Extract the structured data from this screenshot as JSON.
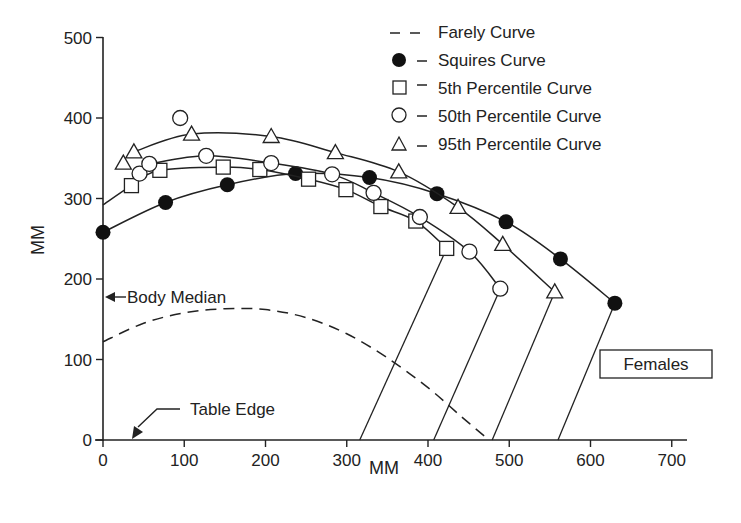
{
  "chart_data": {
    "type": "scatter",
    "title": "",
    "xlabel": "MM",
    "ylabel": "MM",
    "xlim": [
      0,
      700
    ],
    "ylim": [
      0,
      500
    ],
    "x_ticks": [
      0,
      100,
      200,
      300,
      400,
      500,
      600,
      700
    ],
    "y_ticks": [
      0,
      100,
      200,
      300,
      400,
      500
    ],
    "grid": false,
    "legend_position": "top-right",
    "legend": [
      {
        "marker": "dashed-line",
        "label": "Farely Curve"
      },
      {
        "marker": "filled-circle",
        "label": "Squires Curve"
      },
      {
        "marker": "open-square",
        "label": "5th Percentile Curve"
      },
      {
        "marker": "open-circle",
        "label": "50th Percentile Curve"
      },
      {
        "marker": "open-triangle",
        "label": "95th Percentile Curve"
      }
    ],
    "series": [
      {
        "name": "Farely Curve",
        "style": "dashed",
        "points": [
          [
            0,
            122
          ],
          [
            50,
            145
          ],
          [
            100,
            158
          ],
          [
            150,
            163
          ],
          [
            200,
            162
          ],
          [
            250,
            152
          ],
          [
            300,
            132
          ],
          [
            350,
            102
          ],
          [
            400,
            65
          ],
          [
            440,
            30
          ],
          [
            475,
            0
          ]
        ]
      },
      {
        "name": "Squires Curve",
        "marker": "filled-circle",
        "points": [
          [
            0,
            258
          ],
          [
            77,
            295
          ],
          [
            153,
            317
          ],
          [
            237,
            331
          ],
          [
            328,
            326
          ],
          [
            411,
            306
          ],
          [
            496,
            271
          ],
          [
            563,
            225
          ],
          [
            630,
            170
          ]
        ],
        "drop_line": [
          [
            630,
            170
          ],
          [
            560,
            0
          ]
        ]
      },
      {
        "name": "5th Percentile Curve",
        "marker": "open-square",
        "fit_start": [
          0,
          292
        ],
        "points": [
          [
            35,
            316
          ],
          [
            70,
            335
          ],
          [
            148,
            339
          ],
          [
            193,
            336
          ],
          [
            253,
            324
          ],
          [
            299,
            311
          ],
          [
            342,
            290
          ],
          [
            385,
            272
          ],
          [
            423,
            238
          ]
        ],
        "drop_line": [
          [
            423,
            238
          ],
          [
            316,
            0
          ]
        ]
      },
      {
        "name": "50th Percentile Curve",
        "marker": "open-circle",
        "points": [
          [
            45,
            331
          ],
          [
            57,
            343
          ],
          [
            95,
            400
          ],
          [
            127,
            353
          ],
          [
            207,
            344
          ],
          [
            282,
            330
          ],
          [
            333,
            307
          ],
          [
            390,
            277
          ],
          [
            451,
            234
          ],
          [
            489,
            188
          ]
        ],
        "drop_line": [
          [
            489,
            188
          ],
          [
            407,
            0
          ]
        ]
      },
      {
        "name": "95th Percentile Curve",
        "marker": "open-triangle",
        "points": [
          [
            25,
            344
          ],
          [
            38,
            358
          ],
          [
            109,
            380
          ],
          [
            207,
            377
          ],
          [
            286,
            357
          ],
          [
            364,
            333
          ],
          [
            437,
            289
          ],
          [
            492,
            243
          ],
          [
            556,
            184
          ]
        ],
        "drop_line": [
          [
            556,
            184
          ],
          [
            479,
            0
          ]
        ]
      }
    ],
    "annotations": [
      {
        "text": "Body Median",
        "points_to": [
          0,
          178
        ]
      },
      {
        "text": "Table Edge",
        "points_to": [
          35,
          0
        ]
      },
      {
        "text": "Females",
        "boxed": true
      }
    ]
  },
  "axes": {
    "x_title": "MM",
    "y_title": "MM",
    "x_ticks": [
      "0",
      "100",
      "200",
      "300",
      "400",
      "500",
      "600",
      "700"
    ],
    "y_ticks": [
      "0",
      "100",
      "200",
      "300",
      "400",
      "500"
    ]
  },
  "legend": {
    "items": [
      "Farely Curve",
      "Squires Curve",
      "5th Percentile Curve",
      "50th Percentile Curve",
      "95th Percentile Curve"
    ]
  },
  "annotations": {
    "body_median": "Body Median",
    "table_edge": "Table Edge",
    "females": "Females"
  },
  "colors": {
    "ink": "#222222",
    "background": "#ffffff"
  }
}
